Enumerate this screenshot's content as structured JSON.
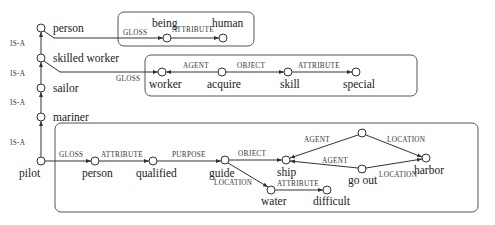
{
  "diagram": {
    "colors": {
      "line": "#333333",
      "box": "#555555",
      "text": "#222222",
      "background": "#ffffff"
    },
    "hierarchy": {
      "relation_label": "IS-A",
      "nodes": [
        {
          "id": "person_top",
          "label": "person"
        },
        {
          "id": "skilled_worker",
          "label": "skilled worker"
        },
        {
          "id": "sailor",
          "label": "sailor"
        },
        {
          "id": "mariner",
          "label": "mariner"
        },
        {
          "id": "pilot",
          "label": "pilot"
        }
      ],
      "edges": [
        {
          "from": "skilled_worker",
          "to": "person_top",
          "label": "IS-A"
        },
        {
          "from": "sailor",
          "to": "skilled_worker",
          "label": "IS-A"
        },
        {
          "from": "mariner",
          "to": "sailor",
          "label": "IS-A"
        },
        {
          "from": "pilot",
          "to": "mariner",
          "label": "IS-A"
        }
      ]
    },
    "gloss_boxes": [
      {
        "id": "gloss_person",
        "source": "person",
        "link_label": "GLOSS",
        "nodes": [
          {
            "id": "being",
            "label": "being"
          },
          {
            "id": "human",
            "label": "human"
          }
        ],
        "edges": [
          {
            "from": "being",
            "to": "human",
            "label": "ATTRIBUTE"
          }
        ]
      },
      {
        "id": "gloss_skilled_worker",
        "source": "skilled worker",
        "link_label": "GLOSS",
        "nodes": [
          {
            "id": "worker",
            "label": "worker"
          },
          {
            "id": "acquire",
            "label": "acquire"
          },
          {
            "id": "skill",
            "label": "skill"
          },
          {
            "id": "special",
            "label": "special"
          }
        ],
        "edges": [
          {
            "from": "acquire",
            "to": "worker",
            "label": "AGENT"
          },
          {
            "from": "acquire",
            "to": "skill",
            "label": "OBJECT"
          },
          {
            "from": "skill",
            "to": "special",
            "label": "ATTRIBUTE"
          }
        ]
      },
      {
        "id": "gloss_pilot",
        "source": "pilot",
        "link_label": "GLOSS",
        "nodes": [
          {
            "id": "person_g",
            "label": "person"
          },
          {
            "id": "qualified",
            "label": "qualified"
          },
          {
            "id": "guide",
            "label": "guide"
          },
          {
            "id": "ship",
            "label": "ship"
          },
          {
            "id": "unnamed",
            "label": ""
          },
          {
            "id": "go_out",
            "label": "go out"
          },
          {
            "id": "harbor",
            "label": "harbor"
          },
          {
            "id": "water",
            "label": "water"
          },
          {
            "id": "difficult",
            "label": "difficult"
          }
        ],
        "edges": [
          {
            "from": "person_g",
            "to": "qualified",
            "label": "ATTRIBUTE"
          },
          {
            "from": "qualified",
            "to": "guide",
            "label": "PURPOSE"
          },
          {
            "from": "guide",
            "to": "ship",
            "label": "OBJECT"
          },
          {
            "from": "guide",
            "to": "water",
            "label": "LOCATION"
          },
          {
            "from": "water",
            "to": "difficult",
            "label": "ATTRIBUTE"
          },
          {
            "from": "unnamed",
            "to": "ship",
            "label": "AGENT"
          },
          {
            "from": "unnamed",
            "to": "harbor",
            "label": "LOCATION"
          },
          {
            "from": "go_out",
            "to": "ship",
            "label": "AGENT"
          },
          {
            "from": "go_out",
            "to": "harbor",
            "label": "LOCATION"
          }
        ]
      }
    ],
    "labels": {
      "isa": "IS-A",
      "gloss": "GLOSS",
      "attribute": "ATTRIBUTE",
      "agent": "AGENT",
      "object": "OBJECT",
      "purpose": "PURPOSE",
      "location": "LOCATION"
    },
    "words": {
      "person_top": "person",
      "skilled_worker": "skilled worker",
      "sailor": "sailor",
      "mariner": "mariner",
      "pilot": "pilot",
      "being": "being",
      "human": "human",
      "worker": "worker",
      "acquire": "acquire",
      "skill": "skill",
      "special": "special",
      "person_g": "person",
      "qualified": "qualified",
      "guide": "guide",
      "ship": "ship",
      "go_out": "go out",
      "harbor": "harbor",
      "water": "water",
      "difficult": "difficult"
    }
  }
}
